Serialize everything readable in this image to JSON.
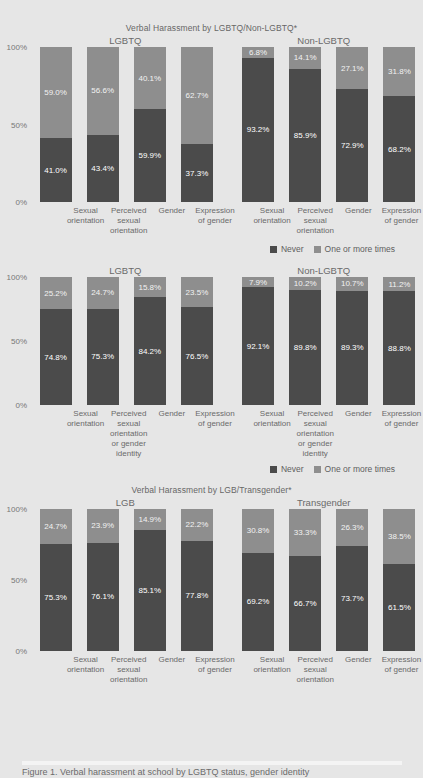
{
  "legend": {
    "never": "Never",
    "one_or_more": "One or more times"
  },
  "axis": {
    "t100": "100%",
    "t50": "50%",
    "t0": "0%"
  },
  "footer": {
    "note": "Figure 1. Verbal harassment at school by LGBTQ status, gender identity"
  },
  "chart_data": [
    {
      "type": "bar",
      "stacked": true,
      "title": "Verbal Harassment by LGBTQ/Non-LGBTQ*",
      "ylabel": "",
      "xlabel": "",
      "ylim": [
        0,
        100
      ],
      "ytick_labels": [
        "0%",
        "50%",
        "100%"
      ],
      "grid": false,
      "legend_position": "bottom-right",
      "legend_entries": [
        "Never",
        "One or more times"
      ],
      "groups": [
        {
          "name": "LGBTQ",
          "categories": [
            "Sexual\norientation",
            "Perceived\nsexual\norientation",
            "Gender",
            "Expression\nof gender"
          ],
          "category_lines": [
            [
              "Sexual",
              "orientation"
            ],
            [
              "Perceived",
              "sexual",
              "orientation"
            ],
            [
              "Gender"
            ],
            [
              "Expression",
              "of gender"
            ]
          ],
          "series": [
            {
              "name": "Never",
              "values": [
                41.0,
                43.4,
                59.9,
                37.3
              ],
              "labels": [
                "41.0%",
                "43.4%",
                "59.9%",
                "37.3%"
              ]
            },
            {
              "name": "One or more times",
              "values": [
                59.0,
                56.6,
                40.1,
                62.7
              ],
              "labels": [
                "59.0%",
                "56.6%",
                "40.1%",
                "62.7%"
              ]
            }
          ]
        },
        {
          "name": "Non-LGBTQ",
          "categories": [
            "Sexual\norientation",
            "Perceived\nsexual\norientation",
            "Gender",
            "Expression\nof gender"
          ],
          "category_lines": [
            [
              "Sexual",
              "orientation"
            ],
            [
              "Perceived",
              "sexual",
              "orientation"
            ],
            [
              "Gender"
            ],
            [
              "Expression",
              "of gender"
            ]
          ],
          "series": [
            {
              "name": "Never",
              "values": [
                93.2,
                85.9,
                72.9,
                68.2
              ],
              "labels": [
                "93.2%",
                "85.9%",
                "72.9%",
                "68.2%"
              ]
            },
            {
              "name": "One or more times",
              "values": [
                6.8,
                14.1,
                27.1,
                31.8
              ],
              "labels": [
                "6.8%",
                "14.1%",
                "27.1%",
                "31.8%"
              ]
            }
          ]
        }
      ]
    },
    {
      "type": "bar",
      "stacked": true,
      "title": "",
      "ylabel": "",
      "xlabel": "",
      "ylim": [
        0,
        100
      ],
      "ytick_labels": [
        "0%",
        "50%",
        "100%"
      ],
      "grid": false,
      "legend_position": "bottom-right",
      "legend_entries": [
        "Never",
        "One or more times"
      ],
      "groups": [
        {
          "name": "LGBTQ",
          "categories": [
            "Sexual\norientation",
            "Perceived\nsexual\norientation\nor gender\nidentity",
            "Gender",
            "Expression\nof gender"
          ],
          "category_lines": [
            [
              "Sexual",
              "orientation"
            ],
            [
              "Perceived",
              "sexual",
              "orientation",
              "or gender",
              "identity"
            ],
            [
              "Gender"
            ],
            [
              "Expression",
              "of gender"
            ]
          ],
          "series": [
            {
              "name": "Never",
              "values": [
                74.8,
                75.3,
                84.2,
                76.5
              ],
              "labels": [
                "74.8%",
                "75.3%",
                "84.2%",
                "76.5%"
              ]
            },
            {
              "name": "One or more times",
              "values": [
                25.2,
                24.7,
                15.8,
                23.5
              ],
              "labels": [
                "25.2%",
                "24.7%",
                "15.8%",
                "23.5%"
              ]
            }
          ]
        },
        {
          "name": "Non-LGBTQ",
          "categories": [
            "Sexual\norientation",
            "Perceived\nsexual\norientation\nor gender\nidentity",
            "Gender",
            "Expression\nof gender"
          ],
          "category_lines": [
            [
              "Sexual",
              "orientation"
            ],
            [
              "Perceived",
              "sexual",
              "orientation",
              "or gender",
              "identity"
            ],
            [
              "Gender"
            ],
            [
              "Expression",
              "of gender"
            ]
          ],
          "series": [
            {
              "name": "Never",
              "values": [
                92.1,
                89.8,
                89.3,
                88.8
              ],
              "labels": [
                "92.1%",
                "89.8%",
                "89.3%",
                "88.8%"
              ]
            },
            {
              "name": "One or more times",
              "values": [
                7.9,
                10.2,
                10.7,
                11.2
              ],
              "labels": [
                "7.9%",
                "10.2%",
                "10.7%",
                "11.2%"
              ]
            }
          ]
        }
      ]
    },
    {
      "type": "bar",
      "stacked": true,
      "title": "Verbal Harassment by LGB/Transgender*",
      "ylabel": "",
      "xlabel": "",
      "ylim": [
        0,
        100
      ],
      "ytick_labels": [
        "0%",
        "50%",
        "100%"
      ],
      "grid": false,
      "legend_position": "none",
      "legend_entries": [
        "Never",
        "One or more times"
      ],
      "groups": [
        {
          "name": "LGB",
          "categories": [
            "Sexual\norientation",
            "Perceived\nsexual\norientation",
            "Gender",
            "Expression\nof gender"
          ],
          "category_lines": [
            [
              "Sexual",
              "orientation"
            ],
            [
              "Perceived",
              "sexual",
              "orientation"
            ],
            [
              "Gender"
            ],
            [
              "Expression",
              "of gender"
            ]
          ],
          "series": [
            {
              "name": "Never",
              "values": [
                75.3,
                76.1,
                85.1,
                77.8
              ],
              "labels": [
                "75.3%",
                "76.1%",
                "85.1%",
                "77.8%"
              ]
            },
            {
              "name": "One or more times",
              "values": [
                24.7,
                23.9,
                14.9,
                22.2
              ],
              "labels": [
                "24.7%",
                "23.9%",
                "14.9%",
                "22.2%"
              ]
            }
          ]
        },
        {
          "name": "Transgender",
          "categories": [
            "Sexual\norientation",
            "Perceived\nsexual\norientation",
            "Gender",
            "Expression\nof gender"
          ],
          "category_lines": [
            [
              "Sexual",
              "orientation"
            ],
            [
              "Perceived",
              "sexual",
              "orientation"
            ],
            [
              "Gender"
            ],
            [
              "Expression",
              "of gender"
            ]
          ],
          "series": [
            {
              "name": "Never",
              "values": [
                69.2,
                66.7,
                73.7,
                61.5
              ],
              "labels": [
                "69.2%",
                "66.7%",
                "73.7%",
                "61.5%"
              ]
            },
            {
              "name": "One or more times",
              "values": [
                30.8,
                33.3,
                26.3,
                38.5
              ],
              "labels": [
                "30.8%",
                "33.3%",
                "26.3%",
                "38.5%"
              ]
            }
          ]
        }
      ]
    }
  ],
  "colors": {
    "never": "#4b4b4b",
    "one_or_more": "#8e8e8e",
    "background": "#e6e6e6",
    "text": "#6a6a6a"
  }
}
